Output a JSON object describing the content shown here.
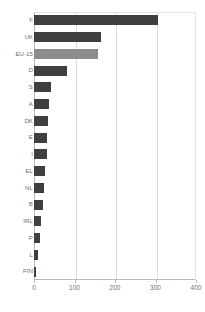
{
  "chart_data": {
    "type": "bar",
    "orientation": "horizontal",
    "title": "",
    "xlabel": "",
    "ylabel": "",
    "xlim": [
      0,
      400
    ],
    "ylim": null,
    "grid": true,
    "legend": null,
    "xticks": [
      "0",
      "100",
      "200",
      "300",
      "400"
    ],
    "xtick_values": [
      0,
      100,
      200,
      300,
      400
    ],
    "categories": [
      "F",
      "UK",
      "EU-15",
      "D",
      "S",
      "A",
      "DK",
      "E",
      "I",
      "EL",
      "NL",
      "B",
      "IRL",
      "P",
      "L",
      "FIN"
    ],
    "values": [
      305,
      165,
      158,
      82,
      41,
      37,
      35,
      33,
      31,
      27,
      24,
      21,
      18,
      14,
      9,
      5
    ],
    "series": [
      {
        "name": "",
        "values": [
          305,
          165,
          158,
          82,
          41,
          37,
          35,
          33,
          31,
          27,
          24,
          21,
          18,
          14,
          9,
          5
        ]
      }
    ],
    "bar_colors": [
      "#3f3f3f",
      "#3f3f3f",
      "#8c8c8c",
      "#3f3f3f",
      "#3f3f3f",
      "#3f3f3f",
      "#3f3f3f",
      "#3f3f3f",
      "#3f3f3f",
      "#3f3f3f",
      "#3f3f3f",
      "#3f3f3f",
      "#3f3f3f",
      "#3f3f3f",
      "#3f3f3f",
      "#3f3f3f"
    ],
    "highlight_category": "EU-15",
    "colors": {
      "bar": "#3f3f3f",
      "highlight_bar": "#8c8c8c",
      "grid": "#dcdcdc",
      "axis": "#b9b9b9",
      "text": "#6e6e6e",
      "background": "#ffffff"
    }
  }
}
